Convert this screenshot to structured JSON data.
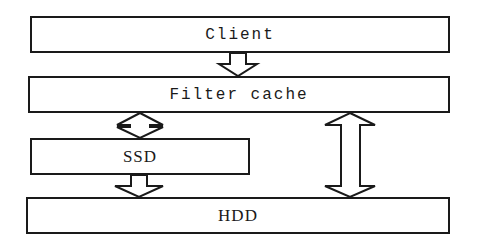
{
  "diagram": {
    "nodes": [
      {
        "id": "client",
        "label": "Client"
      },
      {
        "id": "filter_cache",
        "label": "Filter cache"
      },
      {
        "id": "ssd",
        "label": "SSD"
      },
      {
        "id": "hdd",
        "label": "HDD"
      }
    ],
    "edges": [
      {
        "from": "client",
        "to": "filter_cache",
        "direction": "one-way"
      },
      {
        "from": "filter_cache",
        "to": "ssd",
        "direction": "two-way"
      },
      {
        "from": "ssd",
        "to": "hdd",
        "direction": "one-way"
      },
      {
        "from": "filter_cache",
        "to": "hdd",
        "direction": "two-way"
      }
    ],
    "colors": {
      "stroke": "#1a1a1a",
      "fill": "#ffffff"
    }
  }
}
